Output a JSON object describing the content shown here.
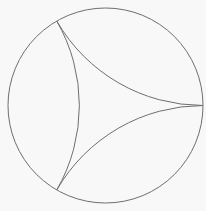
{
  "diagram": {
    "stroke_color": "#6e6e6e",
    "background": "#f8f8f8",
    "disk": {
      "cx": 105.5,
      "cy": 105.5,
      "r": 97.5
    },
    "vertices": [
      {
        "name": "right",
        "x": 203,
        "y": 105.5
      },
      {
        "name": "top",
        "x": 57,
        "y": 21
      },
      {
        "name": "bottom",
        "x": 57,
        "y": 190
      }
    ],
    "geodesic_radius": 169
  }
}
